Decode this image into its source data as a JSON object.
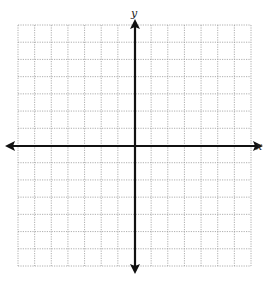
{
  "figure": {
    "type": "coordinate-grid",
    "x_axis_label": "x",
    "y_axis_label": "y",
    "grid": {
      "columns": 14,
      "rows": 14,
      "left": 18,
      "top": 25,
      "right": 251,
      "bottom": 266,
      "line_color": "#9a9a9a",
      "line_style": "dotted"
    },
    "axes": {
      "origin_x": 135,
      "origin_y": 146,
      "color": "#111111",
      "arrows": [
        "left",
        "right",
        "up",
        "down"
      ]
    }
  }
}
